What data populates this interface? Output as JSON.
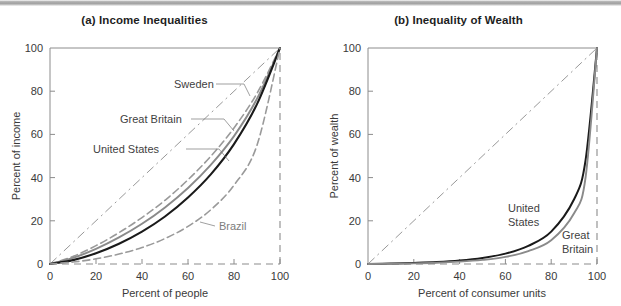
{
  "figure": {
    "background_color": "#ffffff",
    "scan_bar_color": "#a8a8a8"
  },
  "chart_data": [
    {
      "type": "line",
      "panel_id": "a",
      "title": "(a) Income Inequalities",
      "xlabel": "Percent of people",
      "ylabel": "Percent of income",
      "xlim": [
        0,
        100
      ],
      "ylim": [
        0,
        100
      ],
      "xticks": [
        0,
        20,
        40,
        60,
        80,
        100
      ],
      "yticks": [
        0,
        20,
        40,
        60,
        80,
        100
      ],
      "xticklabels": [
        "0",
        "20",
        "40",
        "60",
        "80",
        "100"
      ],
      "yticklabels": [
        "0",
        "20",
        "40",
        "60",
        "80",
        "100"
      ],
      "grid": false,
      "legend": "inline-annotations",
      "reference_line": {
        "name": "line-of-perfect-equality",
        "x": [
          0,
          100
        ],
        "y": [
          0,
          100
        ],
        "style": "dash-dot",
        "color": "#8c8c8c"
      },
      "x": [
        0,
        10,
        20,
        30,
        40,
        50,
        60,
        70,
        80,
        90,
        100
      ],
      "series": [
        {
          "name": "Sweden",
          "label": "Sweden",
          "style": "dashed",
          "color": "#9a9a9a",
          "width": 1.6,
          "values": [
            0,
            3.5,
            8.5,
            14.5,
            21.5,
            29.5,
            39,
            50,
            63,
            79,
            100
          ]
        },
        {
          "name": "Great Britain",
          "label": "Great Britain",
          "style": "solid",
          "color": "#8a8a8a",
          "width": 1.9,
          "values": [
            0,
            2.8,
            7.0,
            12.3,
            18.6,
            26.2,
            35.2,
            46.0,
            59.2,
            76.5,
            100
          ]
        },
        {
          "name": "United States",
          "label": "United States",
          "style": "solid",
          "color": "#1a1a1a",
          "width": 2.1,
          "values": [
            0,
            1.8,
            5.0,
            9.4,
            15.0,
            22.0,
            30.8,
            41.6,
            55.5,
            74.0,
            100
          ]
        },
        {
          "name": "Brazil",
          "label": "Brazil",
          "style": "dashed",
          "color": "#9a9a9a",
          "width": 1.6,
          "values": [
            0,
            0.9,
            2.4,
            4.6,
            7.6,
            11.8,
            17.4,
            25.2,
            36.5,
            55.0,
            100
          ]
        }
      ]
    },
    {
      "type": "line",
      "panel_id": "b",
      "title": "(b) Inequality of Wealth",
      "xlabel": "Percent of consumer units",
      "ylabel": "Percent of wealth",
      "xlim": [
        0,
        100
      ],
      "ylim": [
        0,
        100
      ],
      "xticks": [
        0,
        20,
        40,
        60,
        80,
        100
      ],
      "yticks": [
        0,
        20,
        40,
        60,
        80,
        100
      ],
      "xticklabels": [
        "0",
        "20",
        "40",
        "60",
        "80",
        "100"
      ],
      "yticklabels": [
        "0",
        "20",
        "40",
        "60",
        "80",
        "100"
      ],
      "grid": false,
      "legend": "inline-annotations",
      "reference_line": {
        "name": "line-of-perfect-equality",
        "x": [
          0,
          100
        ],
        "y": [
          0,
          100
        ],
        "style": "dash-dot",
        "color": "#8c8c8c"
      },
      "x": [
        0,
        10,
        20,
        30,
        40,
        50,
        60,
        70,
        80,
        90,
        95,
        100
      ],
      "series": [
        {
          "name": "United States",
          "label": "United States",
          "style": "solid",
          "color": "#1a1a1a",
          "width": 2.0,
          "values": [
            0,
            0.2,
            0.5,
            0.9,
            1.6,
            2.8,
            4.8,
            8.4,
            15.0,
            30.0,
            48.0,
            100
          ]
        },
        {
          "name": "Great Britain",
          "label": "Great Britain",
          "style": "solid",
          "color": "#8a8a8a",
          "width": 1.9,
          "values": [
            0,
            0.1,
            0.3,
            0.6,
            1.1,
            1.9,
            3.3,
            6.0,
            11.0,
            23.5,
            40.0,
            100
          ]
        }
      ]
    }
  ],
  "panel_a": {
    "title": "(a) Income Inequalities",
    "xlabel": "Percent of people",
    "ylabel": "Percent of income",
    "xticks": [
      "0",
      "20",
      "40",
      "60",
      "80",
      "100"
    ],
    "yticks": [
      "0",
      "20",
      "40",
      "60",
      "80",
      "100"
    ],
    "annotations": {
      "sweden": "Sweden",
      "great_britain": "Great Britain",
      "united_states": "United States",
      "brazil": "Brazil"
    }
  },
  "panel_b": {
    "title": "(b) Inequality of Wealth",
    "xlabel": "Percent of consumer units",
    "ylabel": "Percent of wealth",
    "xticks": [
      "0",
      "20",
      "40",
      "60",
      "80",
      "100"
    ],
    "yticks": [
      "0",
      "20",
      "40",
      "60",
      "80",
      "100"
    ],
    "annotations": {
      "united_states_line1": "United",
      "united_states_line2": "States",
      "great_britain_line1": "Great",
      "great_britain_line2": "Britain"
    }
  }
}
